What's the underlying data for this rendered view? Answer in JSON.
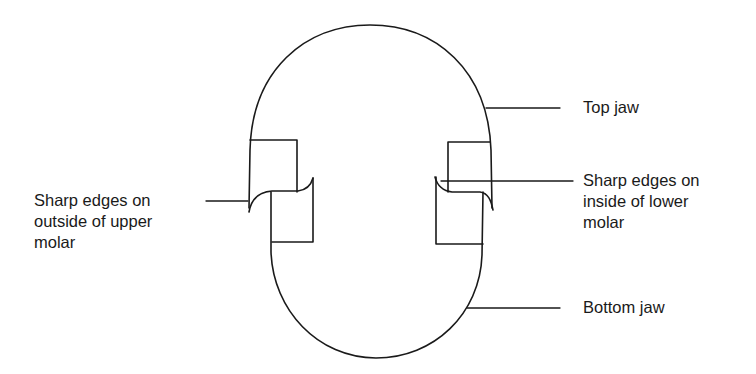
{
  "diagram": {
    "type": "jaw-cross-section",
    "stroke_color": "#1a1a1a",
    "background_color": "#ffffff",
    "labels": {
      "top_jaw": {
        "lines": [
          "Top jaw"
        ]
      },
      "left_molar": {
        "lines": [
          "Sharp edges on",
          "outside of upper",
          "molar"
        ]
      },
      "right_molar": {
        "lines": [
          "Sharp edges on",
          "inside of lower",
          "molar"
        ]
      },
      "bottom_jaw": {
        "lines": [
          "Bottom jaw"
        ]
      }
    }
  }
}
